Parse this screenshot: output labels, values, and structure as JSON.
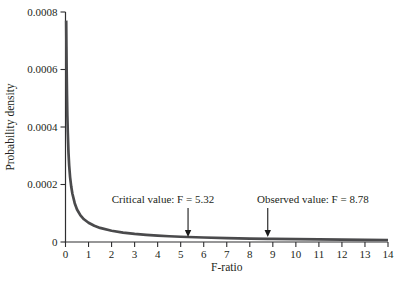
{
  "figure": {
    "background": "#ffffff"
  },
  "colors": {
    "axis": "#2e2e30",
    "text": "#231f20",
    "curve": "#4a4a4c",
    "arrow": "#1a1a1a"
  },
  "chart_data": {
    "type": "line",
    "title": "",
    "xlabel": "F-ratio",
    "ylabel": "Probability density",
    "xlim": [
      0,
      14
    ],
    "ylim": [
      0,
      0.0008
    ],
    "grid": false,
    "legend": "none",
    "x_ticks": [
      0,
      1,
      2,
      3,
      4,
      5,
      6,
      7,
      8,
      9,
      10,
      11,
      12,
      13,
      14
    ],
    "x_tick_labels": [
      "0",
      "1",
      "2",
      "3",
      "4",
      "5",
      "6",
      "7",
      "8",
      "9",
      "10",
      "11",
      "12",
      "13",
      "14"
    ],
    "y_ticks": [
      0,
      0.0002,
      0.0004,
      0.0006,
      0.0008
    ],
    "y_tick_labels": [
      "0",
      "0.0002",
      "0.0004",
      "0.0006",
      "0.0008"
    ],
    "series": [
      {
        "name": "f-distribution-density",
        "color": "#4a4a4c",
        "points": [
          [
            0.03,
            0.00077
          ],
          [
            0.04,
            0.00068
          ],
          [
            0.05,
            0.0006
          ],
          [
            0.065,
            0.00051
          ],
          [
            0.08,
            0.00044
          ],
          [
            0.1,
            0.00038
          ],
          [
            0.13,
            0.00031
          ],
          [
            0.16,
            0.000265
          ],
          [
            0.2,
            0.000225
          ],
          [
            0.25,
            0.000192
          ],
          [
            0.3,
            0.000168
          ],
          [
            0.4,
            0.000135
          ],
          [
            0.5,
            0.000113
          ],
          [
            0.65,
            9.25e-05
          ],
          [
            0.8,
            7.9e-05
          ],
          [
            1.0,
            6.7e-05
          ],
          [
            1.25,
            5.65e-05
          ],
          [
            1.5,
            4.9e-05
          ],
          [
            2.0,
            3.9e-05
          ],
          [
            2.5,
            3.25e-05
          ],
          [
            3.0,
            2.8e-05
          ],
          [
            3.5,
            2.47e-05
          ],
          [
            4.0,
            2.21e-05
          ],
          [
            4.5,
            2e-05
          ],
          [
            5.0,
            1.83e-05
          ],
          [
            5.32,
            1.74e-05
          ],
          [
            6.0,
            1.56e-05
          ],
          [
            7.0,
            1.36e-05
          ],
          [
            8.0,
            1.2e-05
          ],
          [
            8.78,
            1.1e-05
          ],
          [
            9.0,
            1.08e-05
          ],
          [
            10.0,
            9.7e-06
          ],
          [
            11.0,
            8.9e-06
          ],
          [
            12.0,
            8.2e-06
          ],
          [
            13.0,
            7.6e-06
          ],
          [
            14.0,
            7e-06
          ]
        ]
      }
    ],
    "annotations": [
      {
        "label": "Critical value: F = 5.32",
        "x": 5.32,
        "text_center_x": 4.23
      },
      {
        "label": "Observed value: F = 8.78",
        "x": 8.78,
        "text_center_x": 10.74
      }
    ]
  }
}
